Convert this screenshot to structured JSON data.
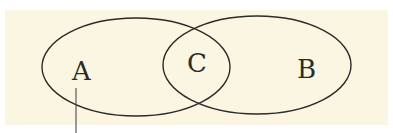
{
  "diagram": {
    "type": "venn",
    "background_color": "#fbf6e2",
    "stroke_color": "#2b2b2b",
    "sets": [
      {
        "id": "A",
        "label": "A"
      },
      {
        "id": "B",
        "label": "B"
      }
    ],
    "intersection": {
      "label": "C"
    },
    "leader_line": {
      "from_set": "A"
    }
  }
}
